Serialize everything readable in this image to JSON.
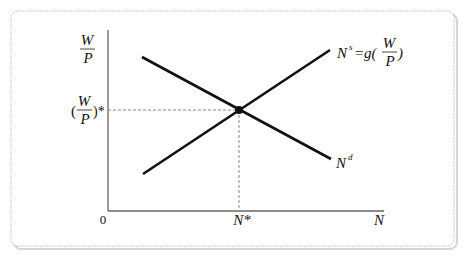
{
  "diagram": {
    "y_axis": {
      "label_numerator": "W",
      "label_denominator": "P"
    },
    "x_axis": {
      "label": "N",
      "origin": "0"
    },
    "equilibrium": {
      "x_label": "N*",
      "y_label_open": "(",
      "y_label_numerator": "W",
      "y_label_denominator": "P",
      "y_label_close": ")*"
    },
    "supply_curve": {
      "label_base": "N",
      "label_sup": "s",
      "label_eq": "=g(",
      "label_numerator": "W",
      "label_denominator": "P",
      "label_close": ")"
    },
    "demand_curve": {
      "label_base": "N",
      "label_sup": "d"
    },
    "colors": {
      "line": "#111111",
      "axis": "#666666",
      "dashed": "#888888",
      "frame": "#bbbbbb"
    }
  }
}
